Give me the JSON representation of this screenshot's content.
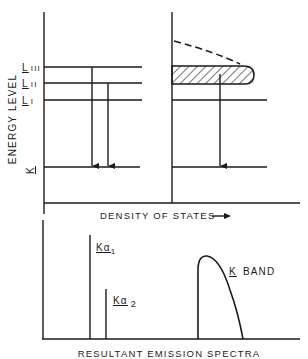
{
  "diagram": {
    "y_axis_label": "ENERGY LEVEL",
    "x_axis_label": "DENSITY OF STATES",
    "x_axis_arrow": "→",
    "bottom_label": "RESULTANT EMISSION SPECTRA",
    "levels": [
      {
        "id": "LIII",
        "label_main": "L",
        "label_sub": "III"
      },
      {
        "id": "LII",
        "label_main": "L",
        "label_sub": "II"
      },
      {
        "id": "LI",
        "label_main": "L",
        "label_sub": "I"
      },
      {
        "id": "K",
        "label_main": "K",
        "label_sub": ""
      }
    ],
    "spectra": {
      "peak1": {
        "main": "Kα",
        "sub": "1"
      },
      "peak2": {
        "main": "Kα",
        "sub": "2"
      },
      "band": {
        "main": "K",
        "rest": "BAND"
      }
    },
    "colors": {
      "ink": "#1a1a1a",
      "background": "#ffffff"
    }
  }
}
